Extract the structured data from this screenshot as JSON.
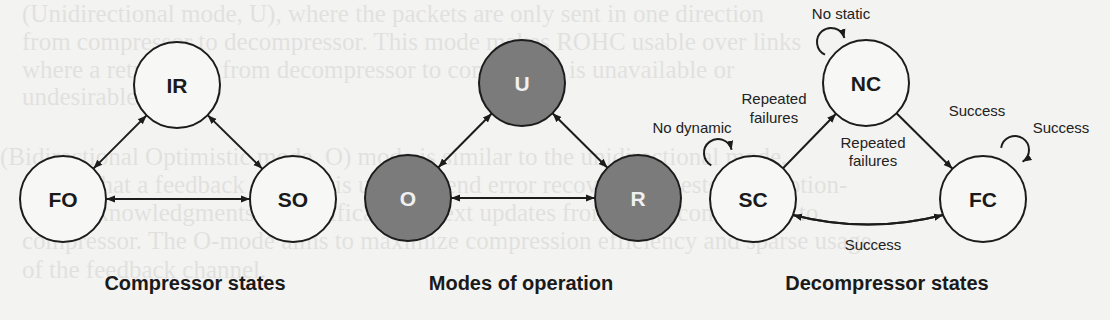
{
  "background_text": {
    "lines": [
      {
        "x": 22,
        "y": 14,
        "text": "(Unidirectional mode, U), where the packets are only sent in one direction"
      },
      {
        "x": 22,
        "y": 42,
        "text": "from compressor to decompressor. This mode makes ROHC usable over links"
      },
      {
        "x": 22,
        "y": 70,
        "text": "where a return path from decompressor to compressor is unavailable or"
      },
      {
        "x": 22,
        "y": 97,
        "text": "undesirable."
      },
      {
        "x": 0,
        "y": 157,
        "text": "(Bidirectional Optimistic mode, O) mode is similar to the unidirectional mode,"
      },
      {
        "x": 22,
        "y": 185,
        "text": "except that a feedback channel is used to send error recovery requests and (option-"
      },
      {
        "x": 22,
        "y": 213,
        "text": "ally) acknowledgments of significant context updates from the decompressor to"
      },
      {
        "x": 22,
        "y": 241,
        "text": "compressor. The O-mode aims to maximize compression efficiency and sparse usage"
      },
      {
        "x": 22,
        "y": 270,
        "text": "of the feedback channel."
      }
    ]
  },
  "colors": {
    "stroke": "#1c1c1c",
    "node_fill_plain": "#f7f7f5",
    "node_fill_dark": "#7b7b7b",
    "label_dark": "#1a1a1a",
    "label_light": "#f0f0f0"
  },
  "panels": [
    {
      "id": "compressor-states",
      "title": "Compressor states",
      "title_pos": {
        "x": 195,
        "y": 290
      },
      "nodes": [
        {
          "id": "IR",
          "label": "IR",
          "cx": 177,
          "cy": 85,
          "r": 43,
          "style": "plain"
        },
        {
          "id": "FO",
          "label": "FO",
          "cx": 63,
          "cy": 199,
          "r": 43,
          "style": "plain"
        },
        {
          "id": "SO",
          "label": "SO",
          "cx": 293,
          "cy": 199,
          "r": 43,
          "style": "plain"
        }
      ],
      "edges": [
        {
          "from": "IR",
          "to": "FO",
          "bidirectional": true
        },
        {
          "from": "IR",
          "to": "SO",
          "bidirectional": true
        },
        {
          "from": "FO",
          "to": "SO",
          "bidirectional": true
        }
      ],
      "edge_labels": []
    },
    {
      "id": "modes-of-operation",
      "title": "Modes of operation",
      "title_pos": {
        "x": 521,
        "y": 290
      },
      "nodes": [
        {
          "id": "U",
          "label": "U",
          "cx": 522,
          "cy": 83,
          "r": 43,
          "style": "dark"
        },
        {
          "id": "O",
          "label": "O",
          "cx": 408,
          "cy": 198,
          "r": 43,
          "style": "dark"
        },
        {
          "id": "R",
          "label": "R",
          "cx": 638,
          "cy": 198,
          "r": 43,
          "style": "dark"
        }
      ],
      "edges": [
        {
          "from": "U",
          "to": "O",
          "bidirectional": true
        },
        {
          "from": "U",
          "to": "R",
          "bidirectional": true
        },
        {
          "from": "O",
          "to": "R",
          "bidirectional": true
        }
      ],
      "edge_labels": []
    },
    {
      "id": "decompressor-states",
      "title": "Decompressor states",
      "title_pos": {
        "x": 887,
        "y": 290
      },
      "nodes": [
        {
          "id": "NC",
          "label": "NC",
          "cx": 866,
          "cy": 83,
          "r": 43,
          "style": "plain"
        },
        {
          "id": "SC",
          "label": "SC",
          "cx": 753,
          "cy": 199,
          "r": 43,
          "style": "plain"
        },
        {
          "id": "FC",
          "label": "FC",
          "cx": 983,
          "cy": 199,
          "r": 43,
          "style": "plain"
        }
      ],
      "edges": [
        {
          "from": "SC",
          "to": "NC",
          "bidirectional": false,
          "label": "Repeated failures"
        },
        {
          "from": "NC",
          "to": "FC",
          "bidirectional": false,
          "label": "Success"
        },
        {
          "from": "FC",
          "to": "SC",
          "bidirectional": false,
          "curve": -22,
          "label": "Repeated failures"
        },
        {
          "from": "SC",
          "to": "FC",
          "bidirectional": false,
          "curve": 22,
          "label": "Success"
        }
      ],
      "self_loops": [
        {
          "node": "NC",
          "label": "No static",
          "lx": 831,
          "ly": 42,
          "lr": 14
        },
        {
          "node": "SC",
          "label": "No dynamic",
          "lx": 718,
          "ly": 153,
          "lr": 14
        },
        {
          "node": "FC",
          "label": "Success",
          "lx": 1015,
          "ly": 150,
          "lr": 14
        }
      ],
      "edge_labels": [
        {
          "text": "No static",
          "x": 841,
          "y": 19,
          "anchor": "middle"
        },
        {
          "text": "Repeated",
          "x": 774,
          "y": 104,
          "anchor": "middle"
        },
        {
          "text": "failures",
          "x": 774,
          "y": 123,
          "anchor": "middle"
        },
        {
          "text": "No dynamic",
          "x": 692,
          "y": 133,
          "anchor": "middle"
        },
        {
          "text": "Success",
          "x": 977,
          "y": 116,
          "anchor": "middle"
        },
        {
          "text": "Success",
          "x": 1061,
          "y": 133,
          "anchor": "middle"
        },
        {
          "text": "Repeated",
          "x": 873,
          "y": 148,
          "anchor": "middle"
        },
        {
          "text": "failures",
          "x": 873,
          "y": 166,
          "anchor": "middle"
        },
        {
          "text": "Success",
          "x": 873,
          "y": 250,
          "anchor": "middle"
        }
      ]
    }
  ]
}
